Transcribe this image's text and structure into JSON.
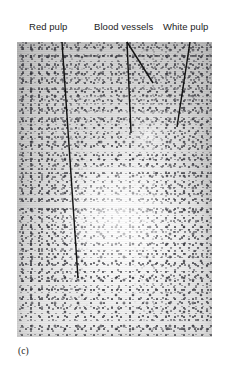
{
  "figure": {
    "panel_caption": "(c)",
    "background_color": "#ffffff",
    "plate": {
      "x": 17,
      "y": 42,
      "width": 195,
      "height": 295,
      "base_color": "#e3e3e3",
      "nucleus_color": "#3c3c44"
    }
  },
  "annotations": {
    "line_color": "#121212",
    "items": [
      {
        "id": "red-pulp",
        "label": "Red pulp",
        "label_x": 29,
        "label_y": 21,
        "leaders": [
          {
            "x1": 62,
            "y1": 42,
            "x2": 78,
            "y2": 278
          }
        ]
      },
      {
        "id": "blood-vessels",
        "label": "Blood vessels",
        "label_x": 94,
        "label_y": 21,
        "leaders": [
          {
            "x1": 127,
            "y1": 42,
            "x2": 131,
            "y2": 133
          },
          {
            "x1": 127,
            "y1": 42,
            "x2": 153,
            "y2": 83
          }
        ]
      },
      {
        "id": "white-pulp",
        "label": "White pulp",
        "label_x": 163,
        "label_y": 21,
        "leaders": [
          {
            "x1": 190,
            "y1": 42,
            "x2": 177,
            "y2": 127
          }
        ]
      }
    ]
  }
}
